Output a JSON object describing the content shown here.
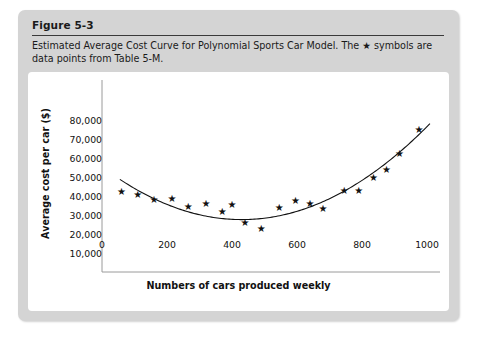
{
  "figure": {
    "title": "Figure 5-3",
    "caption": "Estimated Average Cost Curve for Polynomial Sports Car Model. The ★ symbols are data points from Table 5-M."
  },
  "colors": {
    "card_background": "#d4d4d4",
    "plot_background": "#ffffff",
    "axis": "#9a9a9a",
    "marker": "#111111",
    "curve": "#111111",
    "text": "#1a1a1a"
  },
  "chart_data": {
    "type": "scatter",
    "title": "",
    "xlabel": "Numbers of cars produced weekly",
    "ylabel": "Average cost per car ($)",
    "xlim": [
      0,
      1040
    ],
    "ylim": [
      0,
      85000
    ],
    "xticks": [
      0,
      200,
      400,
      600,
      800,
      1000
    ],
    "xtick_labels": [
      "0",
      "200",
      "400",
      "600",
      "800",
      "1000"
    ],
    "yticks": [
      10000,
      20000,
      30000,
      40000,
      50000,
      60000,
      70000,
      80000
    ],
    "ytick_labels": [
      "10,000",
      "20,000",
      "30,000",
      "40,000",
      "50,000",
      "60,000",
      "70,000",
      "80,000"
    ],
    "grid": false,
    "legend": null,
    "marker_symbol": "★",
    "series": [
      {
        "name": "Data points from Table 5-M",
        "type": "scatter",
        "points": [
          [
            60,
            42000
          ],
          [
            110,
            40500
          ],
          [
            160,
            38000
          ],
          [
            215,
            38500
          ],
          [
            265,
            34000
          ],
          [
            320,
            35500
          ],
          [
            370,
            31500
          ],
          [
            400,
            35000
          ],
          [
            440,
            25500
          ],
          [
            490,
            22500
          ],
          [
            545,
            33500
          ],
          [
            595,
            37500
          ],
          [
            640,
            35500
          ],
          [
            680,
            33000
          ],
          [
            745,
            42500
          ],
          [
            790,
            42500
          ],
          [
            835,
            49500
          ],
          [
            875,
            53500
          ],
          [
            915,
            62000
          ],
          [
            975,
            74500
          ]
        ]
      },
      {
        "name": "Fitted polynomial average cost curve",
        "type": "line",
        "curve": {
          "vertex_x": 430,
          "vertex_y": 27500,
          "x_start": 55,
          "x_end": 1010,
          "y_at_x_start": 43500,
          "y_at_x_end": 78000
        }
      }
    ]
  }
}
